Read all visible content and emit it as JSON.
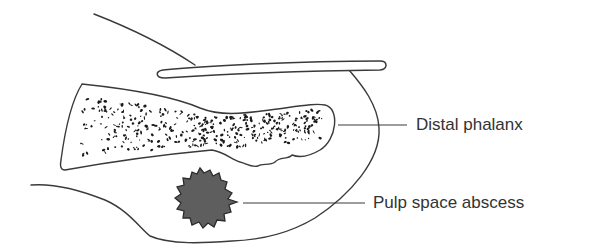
{
  "figure": {
    "labels": [
      {
        "id": "distal-phalanx",
        "text": "Distal phalanx"
      },
      {
        "id": "pulp-space-abscess",
        "text": "Pulp space abscess"
      }
    ]
  },
  "colors": {
    "outline": "#3a3a3a",
    "abscess_fill": "#5e5e5e",
    "label_text": "#333333",
    "background": "#ffffff"
  }
}
